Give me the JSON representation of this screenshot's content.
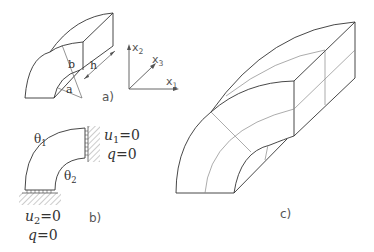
{
  "figure": {
    "panel_a": {
      "caption": "a)",
      "labels": {
        "inner_radius": "a",
        "outer_radius": "b",
        "length": "h"
      },
      "axes": {
        "x1": {
          "base": "x",
          "sub": "1"
        },
        "x2": {
          "base": "x",
          "sub": "2"
        },
        "x3": {
          "base": "x",
          "sub": "3"
        }
      }
    },
    "panel_b": {
      "caption": "b)",
      "theta1": {
        "base": "θ",
        "sub": "1"
      },
      "theta2": {
        "base": "θ",
        "sub": "2"
      },
      "right_bc": {
        "u_base": "u",
        "u_sub": "1",
        "u_val": "=0",
        "q": "q",
        "q_val": "=0"
      },
      "bottom_bc": {
        "u_base": "u",
        "u_sub": "2",
        "u_val": "=0",
        "q": "q",
        "q_val": "=0"
      }
    },
    "panel_c": {
      "caption": "c)"
    },
    "colors": {
      "line": "#333333",
      "mesh": "#888888",
      "hatch": "#999999"
    }
  }
}
